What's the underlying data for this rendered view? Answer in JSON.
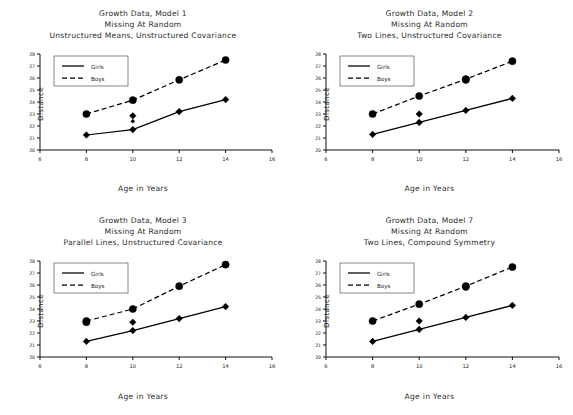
{
  "figure": {
    "axis_labels": {
      "x": "Age in Years",
      "y": "Distance"
    },
    "legend": {
      "girls": "Girls",
      "boys": "Boys"
    },
    "xticks": [
      "6",
      "8",
      "10",
      "12",
      "14",
      "16"
    ],
    "yticks": [
      "20",
      "21",
      "22",
      "23",
      "24",
      "25",
      "26",
      "27",
      "28"
    ]
  },
  "chart_data": [
    {
      "id": "model1",
      "type": "line",
      "title": "Growth Data, Model 1",
      "subtitle": "Missing At Random",
      "subtitle2": "Unstructured Means, Unstructured Covariance",
      "xlabel": "Age in Years",
      "ylabel": "Distance",
      "xlim": [
        6,
        16
      ],
      "ylim": [
        20,
        28
      ],
      "xticks": [
        6,
        8,
        10,
        12,
        14,
        16
      ],
      "yticks": [
        20,
        21,
        22,
        23,
        24,
        25,
        26,
        27,
        28
      ],
      "grid": false,
      "legend_position": "upper-left",
      "x": [
        8,
        10,
        12,
        14
      ],
      "series": [
        {
          "name": "Girls",
          "style": "solid",
          "marker": "diamond",
          "values": [
            21.25,
            21.7,
            23.2,
            24.2
          ]
        },
        {
          "name": "Boys",
          "style": "dashed",
          "marker": "circle",
          "values": [
            23.0,
            24.15,
            25.85,
            27.5
          ]
        }
      ],
      "extra_markers": [
        {
          "series": "Girls",
          "x": 10,
          "y": 22.85,
          "marker": "diamond"
        },
        {
          "series": "Girls",
          "x": 10,
          "y": 22.4,
          "marker": "small-diamond"
        }
      ]
    },
    {
      "id": "model2",
      "type": "line",
      "title": "Growth Data, Model 2",
      "subtitle": "Missing At Random",
      "subtitle2": "Two Lines, Unstructured Covariance",
      "xlabel": "Age in Years",
      "ylabel": "Distance",
      "xlim": [
        6,
        16
      ],
      "ylim": [
        20,
        28
      ],
      "xticks": [
        6,
        8,
        10,
        12,
        14,
        16
      ],
      "yticks": [
        20,
        21,
        22,
        23,
        24,
        25,
        26,
        27,
        28
      ],
      "grid": false,
      "legend_position": "upper-left",
      "x": [
        8,
        10,
        12,
        14
      ],
      "series": [
        {
          "name": "Girls",
          "style": "solid",
          "marker": "diamond",
          "values": [
            21.3,
            22.3,
            23.3,
            24.3
          ]
        },
        {
          "name": "Boys",
          "style": "dashed",
          "marker": "circle",
          "values": [
            23.0,
            24.5,
            25.9,
            27.4
          ]
        }
      ],
      "extra_markers": [
        {
          "series": "Girls",
          "x": 10,
          "y": 23.0,
          "marker": "diamond"
        },
        {
          "series": "Boys",
          "x": 12,
          "y": 25.85,
          "marker": "circle"
        }
      ]
    },
    {
      "id": "model3",
      "type": "line",
      "title": "Growth Data, Model 3",
      "subtitle": "Missing At Random",
      "subtitle2": "Parallel Lines, Unstructured Covariance",
      "xlabel": "Age in Years",
      "ylabel": "Distance",
      "xlim": [
        6,
        16
      ],
      "ylim": [
        20,
        28
      ],
      "xticks": [
        6,
        8,
        10,
        12,
        14,
        16
      ],
      "yticks": [
        20,
        21,
        22,
        23,
        24,
        25,
        26,
        27,
        28
      ],
      "grid": false,
      "legend_position": "upper-left",
      "x": [
        8,
        10,
        12,
        14
      ],
      "series": [
        {
          "name": "Girls",
          "style": "solid",
          "marker": "diamond",
          "values": [
            21.3,
            22.2,
            23.2,
            24.2
          ]
        },
        {
          "name": "Boys",
          "style": "dashed",
          "marker": "circle",
          "values": [
            23.0,
            24.0,
            25.9,
            27.7
          ]
        }
      ],
      "extra_markers": [
        {
          "series": "Girls",
          "x": 10,
          "y": 22.9,
          "marker": "diamond"
        },
        {
          "series": "Boys",
          "x": 8,
          "y": 22.9,
          "marker": "circle"
        }
      ]
    },
    {
      "id": "model7",
      "type": "line",
      "title": "Growth Data, Model 7",
      "subtitle": "Missing At Random",
      "subtitle2": "Two Lines, Compound Symmetry",
      "xlabel": "Age in Years",
      "ylabel": "Distance",
      "xlim": [
        6,
        16
      ],
      "ylim": [
        20,
        28
      ],
      "xticks": [
        6,
        8,
        10,
        12,
        14,
        16
      ],
      "yticks": [
        20,
        21,
        22,
        23,
        24,
        25,
        26,
        27,
        28
      ],
      "grid": false,
      "legend_position": "upper-left",
      "x": [
        8,
        10,
        12,
        14
      ],
      "series": [
        {
          "name": "Girls",
          "style": "solid",
          "marker": "diamond",
          "values": [
            21.3,
            22.3,
            23.3,
            24.3
          ]
        },
        {
          "name": "Boys",
          "style": "dashed",
          "marker": "circle",
          "values": [
            23.0,
            24.4,
            25.9,
            27.5
          ]
        }
      ],
      "extra_markers": [
        {
          "series": "Girls",
          "x": 10,
          "y": 23.0,
          "marker": "diamond"
        },
        {
          "series": "Boys",
          "x": 12,
          "y": 25.85,
          "marker": "circle"
        }
      ]
    }
  ]
}
